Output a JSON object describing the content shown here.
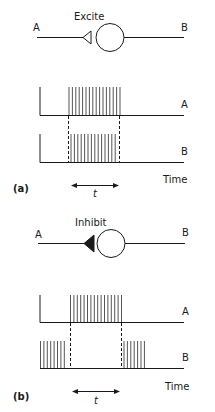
{
  "figure": {
    "panels": [
      {
        "id": "a",
        "panel_label": "(a)",
        "synapse_label": "Excite",
        "synapse_type": "excitatory",
        "terminal_icon": "open-triangle",
        "neuron_labels": {
          "pre": "A",
          "post": "B"
        },
        "traces": [
          {
            "label": "A",
            "description": "baseline, then burst of spikes during t, then silent"
          },
          {
            "label": "B",
            "description": "baseline, then burst of spikes during t (follows A), then silent"
          }
        ],
        "time_axis_label": "Time",
        "interval_label": "t"
      },
      {
        "id": "b",
        "panel_label": "(b)",
        "synapse_label": "Inhibit",
        "synapse_type": "inhibitory",
        "terminal_icon": "filled-triangle",
        "neuron_labels": {
          "pre": "A",
          "post": "B"
        },
        "traces": [
          {
            "label": "A",
            "description": "baseline, then burst of spikes during t, then silent"
          },
          {
            "label": "B",
            "description": "spontaneous spikes, silenced during t, resumes firing after t"
          }
        ],
        "time_axis_label": "Time",
        "interval_label": "t"
      }
    ]
  },
  "colors": {
    "ink": "#1a1a1a",
    "background": "#ffffff",
    "spike": "#555555"
  }
}
